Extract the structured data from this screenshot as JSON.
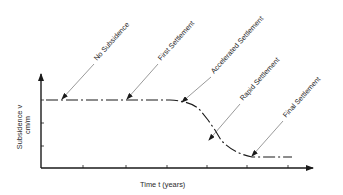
{
  "diagram": {
    "axes": {
      "x_label": "Time t (years)",
      "y_label_line1": "Subsidence  v",
      "y_label_line2": "cm/m"
    },
    "stages": [
      {
        "id": "no-subsidence",
        "label": "No Subsidence"
      },
      {
        "id": "first-settlement",
        "label": "First Settlement"
      },
      {
        "id": "accelerated-settlement",
        "label": "Accelerated Settlement"
      },
      {
        "id": "rapid-settlement",
        "label": "Rapid Settlement"
      },
      {
        "id": "final-settlement",
        "label": "Final Settlement"
      }
    ],
    "colors": {
      "ink": "#1a1a1a",
      "leader": "#555555",
      "background": "#ffffff"
    }
  }
}
